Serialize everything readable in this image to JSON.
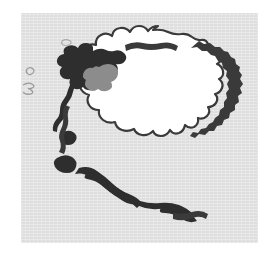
{
  "figure": {
    "name": "antarctica-map",
    "kind": "map",
    "width": 276,
    "height": 262
  },
  "page": {
    "background_color": "#ffffff"
  },
  "panel": {
    "name": "map-panel",
    "background_color": "#e3e3e3",
    "ocean_label": "Southern Ocean",
    "x": 21,
    "y": 13,
    "width": 237,
    "height": 230
  },
  "colors": {
    "ocean": "#e3e3e3",
    "ice_sheet": "#ffffff",
    "coastline": "#3a3a3a",
    "exposed_land": "#2e2e2e",
    "peninsula_highland": "#8c8c8c",
    "island_outline": "#9a9a9a",
    "page": "#ffffff"
  },
  "features": {
    "ice_sheet": {
      "label": "Antarctic Ice Sheet",
      "fill": "#ffffff"
    },
    "coastline": {
      "label": "Coastline",
      "stroke": "#3a3a3a"
    },
    "peninsula": {
      "label": "Antarctic Peninsula",
      "fill": "#2e2e2e",
      "highland_fill": "#8c8c8c"
    },
    "west_coast_land": {
      "label": "Exposed rock - Ellsworth / Marie Byrd Land",
      "fill": "#2e2e2e"
    },
    "ross_coast_land": {
      "label": "Exposed rock - Ross Sea coast",
      "fill": "#2e2e2e"
    },
    "islands": [
      {
        "name": "sub-antarctic-island-north",
        "fill": "none",
        "stroke": "#a8a8a8"
      },
      {
        "name": "sub-antarctic-island-west-upper",
        "fill": "none",
        "stroke": "#9a9a9a"
      },
      {
        "name": "sub-antarctic-island-west-lower",
        "fill": "none",
        "stroke": "#9a9a9a"
      }
    ]
  }
}
